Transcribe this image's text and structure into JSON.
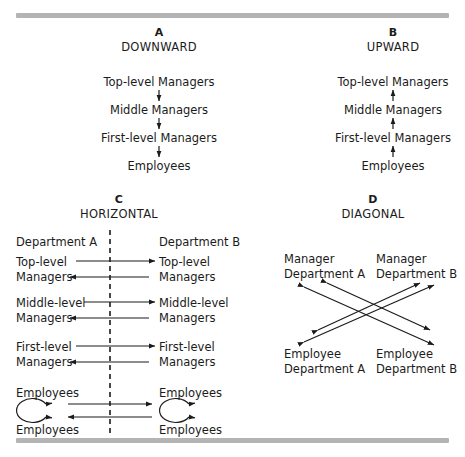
{
  "figure": {
    "panels": [
      {
        "letter": "A",
        "title": "DOWNWARD",
        "direction": "down",
        "nodes": [
          "Top-level Managers",
          "Middle Managers",
          "First-level Managers",
          "Employees"
        ]
      },
      {
        "letter": "B",
        "title": "UPWARD",
        "direction": "up",
        "nodes": [
          "Top-level Managers",
          "Middle Managers",
          "First-level Managers",
          "Employees"
        ]
      },
      {
        "letter": "C",
        "title": "HORIZONTAL",
        "direction": "horizontal",
        "column_headers": [
          "Department A",
          "Department B"
        ],
        "rows": [
          {
            "left_line1": "Top-level",
            "left_line2": "Managers",
            "right_line1": "Top-level",
            "right_line2": "Managers"
          },
          {
            "left_line1": "Middle-level",
            "left_line2": "Managers",
            "right_line1": "Middle-level",
            "right_line2": "Managers"
          },
          {
            "left_line1": "First-level",
            "left_line2": "Managers",
            "right_line1": "First-level",
            "right_line2": "Managers"
          }
        ],
        "employee_block": {
          "left_top": "Employees",
          "left_bottom": "Employees",
          "right_top": "Employees",
          "right_bottom": "Employees"
        }
      },
      {
        "letter": "D",
        "title": "DIAGONAL",
        "direction": "diagonal",
        "nodes": [
          {
            "line1": "Manager",
            "line2": "Department A",
            "position": "top-left"
          },
          {
            "line1": "Manager",
            "line2": "Department B",
            "position": "top-right"
          },
          {
            "line1": "Employee",
            "line2": "Department A",
            "position": "bottom-left"
          },
          {
            "line1": "Employee",
            "line2": "Department B",
            "position": "bottom-right"
          }
        ]
      }
    ]
  },
  "colors": {
    "rule": "#b4b4b4",
    "ink": "#1b1b1b",
    "background": "#ffffff"
  }
}
